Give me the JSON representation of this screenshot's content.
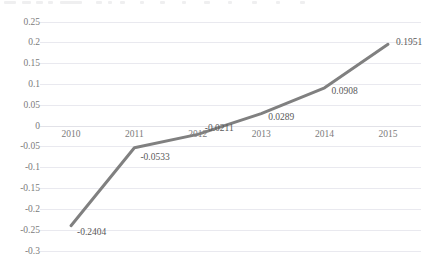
{
  "chart_data": {
    "type": "line",
    "title": "",
    "xlabel": "",
    "ylabel": "",
    "categories": [
      "2010",
      "2011",
      "2012",
      "2013",
      "2014",
      "2015"
    ],
    "values": [
      -0.2404,
      -0.0533,
      -0.0211,
      0.0289,
      0.0908,
      0.1951
    ],
    "data_labels": [
      "-0.2404",
      "-0.0533",
      "-0.0211",
      "0.0289",
      "0.0908",
      "0.1951"
    ],
    "ylim": [
      -0.3,
      0.25
    ],
    "ytick_step": 0.05,
    "ytick_labels": [
      "0.25",
      "0.2",
      "0.15",
      "0.1",
      "0.05",
      "0",
      "-0.05",
      "-0.1",
      "-0.15",
      "-0.2",
      "-0.25",
      "-0.3"
    ],
    "ytick_values": [
      0.25,
      0.2,
      0.15,
      0.1,
      0.05,
      0,
      -0.05,
      -0.1,
      -0.15,
      -0.2,
      -0.25,
      -0.3
    ],
    "grid": "horizontal",
    "legend": "none",
    "series": [
      {
        "name": "Series1",
        "color": "#808080",
        "line_width": 3,
        "values": [
          -0.2404,
          -0.0533,
          -0.0211,
          0.0289,
          0.0908,
          0.1951
        ]
      }
    ],
    "axis_crosses_at": 0,
    "gridline_color": "#e9e9ef",
    "tick_label_color": "#7b7b7b",
    "data_label_color": "#595959"
  }
}
